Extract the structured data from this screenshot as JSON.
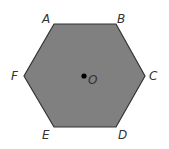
{
  "diagram": {
    "shape": "regular hexagon",
    "fill_color": "#808080",
    "stroke_color": "#333333",
    "vertices": [
      {
        "label": "A",
        "x": 54,
        "y": 24
      },
      {
        "label": "B",
        "x": 116,
        "y": 24
      },
      {
        "label": "C",
        "x": 145,
        "y": 76
      },
      {
        "label": "D",
        "x": 116,
        "y": 127
      },
      {
        "label": "E",
        "x": 54,
        "y": 127
      },
      {
        "label": "F",
        "x": 24,
        "y": 76
      }
    ],
    "center": {
      "label": "O",
      "x": 84,
      "y": 76
    }
  }
}
